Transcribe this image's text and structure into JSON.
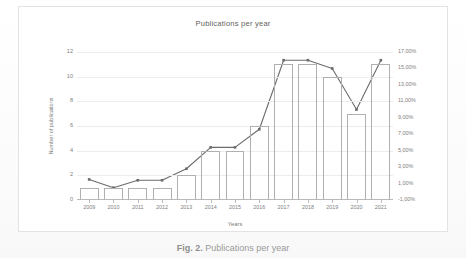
{
  "figure": {
    "caption_label": "Fig. 2.",
    "caption_text": "Publications per year"
  },
  "chart_data": {
    "type": "bar",
    "title": "Publications per year",
    "xlabel": "Years",
    "ylabel": "Number of publications",
    "y2label": "",
    "categories": [
      "2009",
      "2010",
      "2011",
      "2012",
      "2013",
      "2014",
      "2015",
      "2016",
      "2017",
      "2018",
      "2019",
      "2020",
      "2021"
    ],
    "series": [
      {
        "name": "Number of publications",
        "type": "bar",
        "axis": "left",
        "values": [
          1,
          1,
          1,
          1,
          2,
          4,
          4,
          6,
          11,
          11,
          10,
          7,
          11
        ]
      },
      {
        "name": "Percentage",
        "type": "line",
        "axis": "right",
        "values": [
          1.5,
          0.5,
          1.4,
          1.4,
          2.8,
          5.4,
          5.4,
          7.6,
          16.0,
          16.0,
          15.0,
          10.0,
          16.0
        ]
      }
    ],
    "ylim": [
      0,
      12
    ],
    "yticks": [
      0,
      2,
      4,
      6,
      8,
      10,
      12
    ],
    "ytick_labels": [
      "0",
      "2",
      "4",
      "6",
      "8",
      "10",
      "12"
    ],
    "y2lim": [
      -1,
      17
    ],
    "y2ticks": [
      -1,
      1,
      3,
      5,
      7,
      9,
      11,
      13,
      15,
      17
    ],
    "y2tick_labels": [
      "-1,00%",
      "1,00%",
      "3,00%",
      "5,00%",
      "7,00%",
      "9,00%",
      "11,00%",
      "13,00%",
      "15,00%",
      "17,00%"
    ],
    "grid": true,
    "legend": "none",
    "colors": {
      "bar_outline": "#b0b0b0",
      "line": "#6b6b6b",
      "grid": "#ececec",
      "text": "#808080"
    }
  }
}
